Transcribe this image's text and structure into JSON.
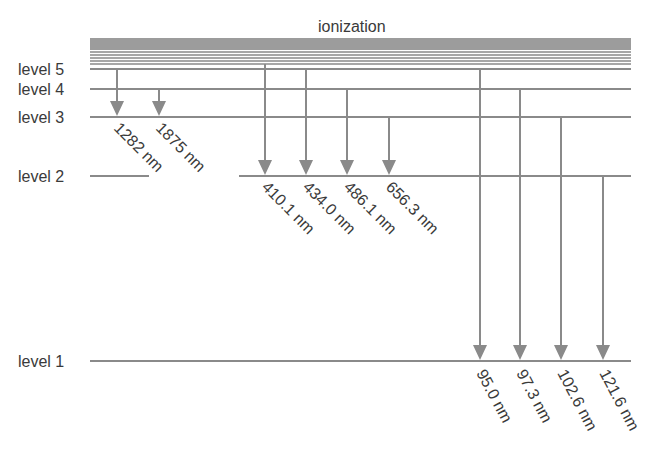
{
  "title": "ionization",
  "colors": {
    "line": "#8a8a8a",
    "arrow": "#8a8a8a",
    "text": "#3a3a3a"
  },
  "levels": [
    {
      "label": "level 5",
      "y": 69
    },
    {
      "label": "level 4",
      "y": 89
    },
    {
      "label": "level 3",
      "y": 117
    },
    {
      "label": "level 2",
      "y": 176
    },
    {
      "label": "level 1",
      "y": 361
    }
  ],
  "series": [
    {
      "name": "paschen",
      "to_level": 3,
      "transitions": [
        {
          "from": 5,
          "x": 117,
          "label": "1282 nm"
        },
        {
          "from": 4,
          "x": 159,
          "label": "1875 nm"
        }
      ]
    },
    {
      "name": "balmer",
      "to_level": 2,
      "transitions": [
        {
          "from": 6,
          "x": 265,
          "label": "410.1 nm"
        },
        {
          "from": 5,
          "x": 306,
          "label": "434.0 nm"
        },
        {
          "from": 4,
          "x": 347,
          "label": "486.1 nm"
        },
        {
          "from": 3,
          "x": 389,
          "label": "656.3 nm"
        }
      ]
    },
    {
      "name": "lyman",
      "to_level": 1,
      "transitions": [
        {
          "from": 5,
          "x": 480,
          "label": "95.0 nm"
        },
        {
          "from": 4,
          "x": 520,
          "label": "97.3 nm"
        },
        {
          "from": 3,
          "x": 561,
          "label": "102.6 nm"
        },
        {
          "from": 2,
          "x": 603,
          "label": "121.6 nm"
        }
      ]
    }
  ]
}
